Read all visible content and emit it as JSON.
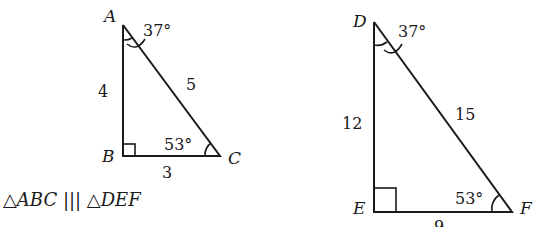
{
  "figure": {
    "triangle_abc": {
      "vertices": {
        "A": "A",
        "B": "B",
        "C": "C"
      },
      "sides": {
        "AB": "4",
        "AC": "5",
        "BC": "3"
      },
      "angles": {
        "A": "37°",
        "C": "53°"
      },
      "right_angle_at": "B"
    },
    "triangle_def": {
      "vertices": {
        "D": "D",
        "E": "E",
        "F": "F"
      },
      "sides": {
        "DE": "12",
        "DF": "15",
        "EF": "9"
      },
      "angles": {
        "D": "37°",
        "F": "53°"
      },
      "right_angle_at": "E"
    },
    "similarity_statement": "△ABC ||| △DEF",
    "colors": {
      "ink": "#1a1a1a",
      "background": "#ffffff"
    }
  }
}
